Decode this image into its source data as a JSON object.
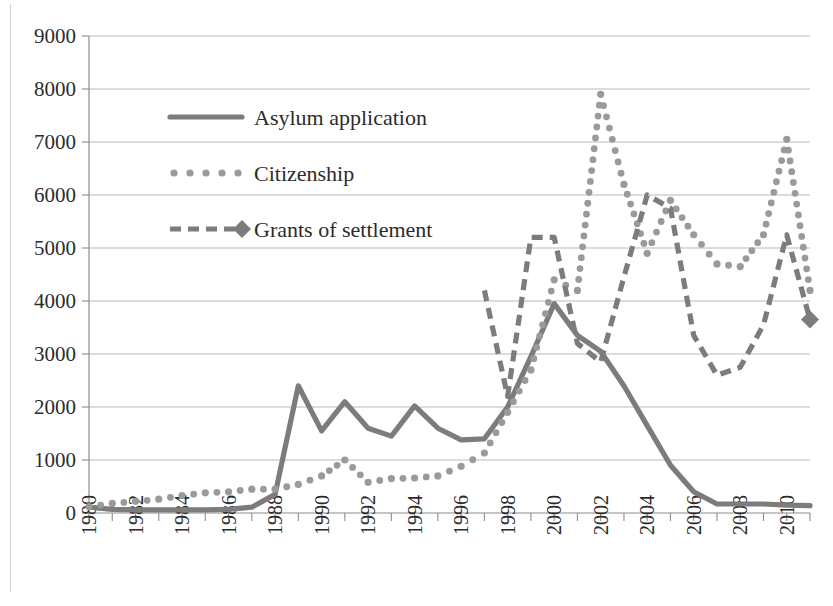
{
  "chart_data": {
    "type": "line",
    "title": "",
    "subtitle": "",
    "xlabel": "",
    "ylabel": "",
    "xlim": [
      1980,
      2011
    ],
    "ylim": [
      0,
      9000
    ],
    "grid": true,
    "legend_position": "inside-top-left",
    "y_ticks": [
      0,
      1000,
      2000,
      3000,
      4000,
      5000,
      6000,
      7000,
      8000,
      9000
    ],
    "y_tick_labels": [
      "0",
      "1000",
      "2000",
      "3000",
      "4000",
      "5000",
      "6000",
      "7000",
      "8000",
      "9000"
    ],
    "x_ticks": [
      1980,
      1982,
      1984,
      1986,
      1988,
      1990,
      1992,
      1994,
      1996,
      1998,
      2000,
      2002,
      2004,
      2006,
      2008,
      2010
    ],
    "x_tick_labels": [
      "1980",
      "1982",
      "1984",
      "1986",
      "1988",
      "1990",
      "1992",
      "1994",
      "1996",
      "1998",
      "2000",
      "2002",
      "2004",
      "2006",
      "2008",
      "2010"
    ],
    "x": [
      1980,
      1981,
      1982,
      1983,
      1984,
      1985,
      1986,
      1987,
      1988,
      1989,
      1990,
      1991,
      1992,
      1993,
      1994,
      1995,
      1996,
      1997,
      1998,
      1999,
      2000,
      2001,
      2002,
      2003,
      2004,
      2005,
      2006,
      2007,
      2008,
      2009,
      2010,
      2011
    ],
    "series": [
      {
        "name": "Asylum application",
        "style": "solid",
        "color": "#7c7c7c",
        "x": [
          1980,
          1981,
          1982,
          1983,
          1984,
          1985,
          1986,
          1987,
          1988,
          1989,
          1990,
          1991,
          1992,
          1993,
          1994,
          1995,
          1996,
          1997,
          1998,
          1999,
          2000,
          2001,
          2002,
          2003,
          2004,
          2005,
          2006,
          2007,
          2008,
          2009,
          2010,
          2011
        ],
        "values": [
          110,
          70,
          60,
          60,
          60,
          60,
          70,
          110,
          350,
          2400,
          1550,
          2100,
          1600,
          1450,
          2020,
          1600,
          1380,
          1400,
          2000,
          2950,
          3950,
          3350,
          3050,
          2400,
          1650,
          900,
          400,
          170,
          170,
          170,
          150,
          140
        ]
      },
      {
        "name": "Citizenship",
        "style": "dotted",
        "color": "#9a9a9a",
        "x": [
          1980,
          1981,
          1982,
          1983,
          1984,
          1985,
          1986,
          1987,
          1988,
          1989,
          1990,
          1991,
          1992,
          1993,
          1994,
          1995,
          1996,
          1997,
          1998,
          1999,
          2000,
          2001,
          2002,
          2003,
          2004,
          2005,
          2006,
          2007,
          2008,
          2009,
          2010,
          2011
        ],
        "values": [
          120,
          180,
          220,
          260,
          330,
          380,
          400,
          450,
          450,
          540,
          700,
          1000,
          580,
          650,
          660,
          700,
          880,
          1130,
          1900,
          2700,
          4400,
          4200,
          7900,
          6200,
          4900,
          5900,
          5250,
          4700,
          4650,
          5250,
          7050,
          4200
        ]
      },
      {
        "name": "Grants of settlement",
        "style": "dashed",
        "color": "#7c7c7c",
        "marker": "diamond-last",
        "x": [
          1997,
          1998,
          1999,
          2000,
          2001,
          2002,
          2003,
          2004,
          2005,
          2006,
          2007,
          2008,
          2009,
          2010,
          2011
        ],
        "values": [
          4200,
          2200,
          5200,
          5200,
          3200,
          2850,
          4450,
          6000,
          5750,
          3350,
          2600,
          2750,
          3550,
          5250,
          3650
        ]
      }
    ],
    "legend": [
      {
        "label": "Asylum application",
        "style": "solid"
      },
      {
        "label": "Citizenship",
        "style": "dotted"
      },
      {
        "label": "Grants of settlement",
        "style": "dashed-diamond"
      }
    ]
  }
}
